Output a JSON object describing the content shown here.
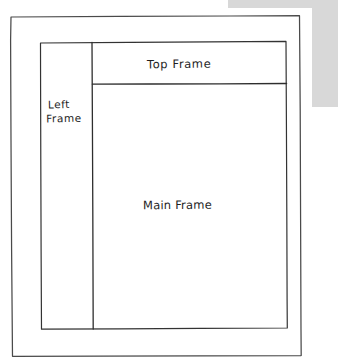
{
  "document": {
    "type": "hand-drawn wireframe sketch",
    "medium": "pen on white paper",
    "subject": "HTML frameset page layout"
  },
  "colors": {
    "paper": "#ffffff",
    "ink": "#2e2e2e",
    "outer_border_ink": "#4a4a4a",
    "scan_background": "#d8d8d8"
  },
  "frames": {
    "top": {
      "label": "Top Frame",
      "label_line_1": "Top Frame"
    },
    "left": {
      "label": "Left Frame",
      "label_line_1": "Left",
      "label_line_2": "Frame"
    },
    "main": {
      "label": "Main Frame",
      "label_line_1": "Main Frame"
    }
  },
  "regions": {
    "outer_border": "page outline",
    "scan_edge": "grey scanner background at top right"
  }
}
